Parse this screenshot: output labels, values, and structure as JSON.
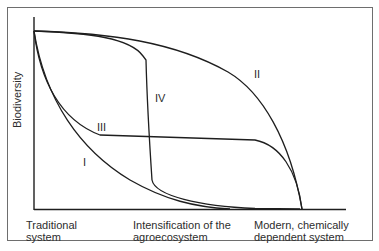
{
  "diagram": {
    "y_axis_label": "Biodiversity",
    "x_axis_labels": [
      {
        "line1": "Traditional",
        "line2": "system"
      },
      {
        "line1": "Intensification of the",
        "line2": "agroecosystem"
      },
      {
        "line1": "Modern, chemically",
        "line2": "dependent system"
      }
    ],
    "curves": [
      {
        "id": "I",
        "label": "I",
        "description": "Rapid decline from start, convex-down decay to zero near intensification"
      },
      {
        "id": "II",
        "label": "II",
        "description": "Biodiversity maintained, slow decline then steep drop near modern system"
      },
      {
        "id": "III",
        "label": "III",
        "description": "Early drop to a plateau, then decline to zero at modern system"
      },
      {
        "id": "IV",
        "label": "IV",
        "description": "Maintained high until intensification, then abrupt collapse"
      }
    ],
    "colors": {
      "line": "#1e1e1e",
      "border": "#6e6e6e",
      "text": "#2d2d2d",
      "background": "#ffffff"
    }
  }
}
